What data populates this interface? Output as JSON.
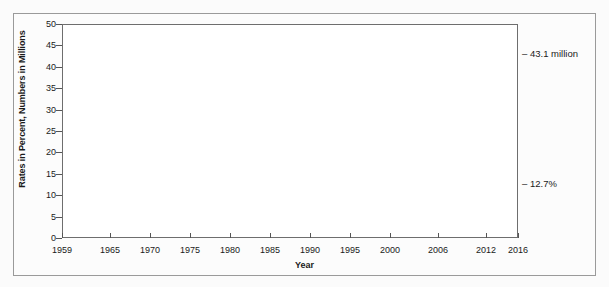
{
  "chart_data": {
    "type": "area",
    "title": "",
    "subtitle": "",
    "xlabel": "Year",
    "ylabel": "Rates in Percent, Numbers in Millions",
    "xlim": [
      1959,
      2016
    ],
    "ylim": [
      0,
      50
    ],
    "grid": false,
    "legend_position": "inside-plot-labels",
    "y_ticks": [
      50,
      45,
      40,
      35,
      30,
      25,
      20,
      15,
      10,
      5,
      0
    ],
    "x_ticks": [
      "1959",
      "1965",
      "1970",
      "1975",
      "1980",
      "1985",
      "1990",
      "1995",
      "2000",
      "2006",
      "2012",
      "2016"
    ],
    "x_tick_values": [
      1959,
      1965,
      1970,
      1975,
      1980,
      1985,
      1990,
      1995,
      2000,
      2006,
      2012,
      2016
    ],
    "series": [
      {
        "name": "Number in poverty",
        "unit": "millions",
        "color": "#3b3b3b",
        "label": "Number in poverty",
        "end_annotation": "43.1 million",
        "x": [
          1959,
          1960,
          1961,
          1962,
          1963,
          1964,
          1965,
          1966,
          1967,
          1968,
          1969,
          1970,
          1971,
          1972,
          1973,
          1974,
          1975,
          1976,
          1977,
          1978,
          1979,
          1980,
          1981,
          1982,
          1983,
          1984,
          1985,
          1986,
          1987,
          1988,
          1989,
          1990,
          1991,
          1992,
          1993,
          1994,
          1995,
          1996,
          1997,
          1998,
          1999,
          2000,
          2001,
          2002,
          2003,
          2004,
          2005,
          2006,
          2007,
          2008,
          2009,
          2010,
          2011,
          2012,
          2013,
          2014,
          2015,
          2016
        ],
        "values": [
          39.5,
          39.9,
          39.6,
          38.6,
          36.4,
          36.1,
          33.2,
          28.5,
          27.8,
          25.4,
          24.1,
          25.4,
          25.6,
          24.5,
          23.0,
          23.4,
          25.9,
          25.0,
          24.7,
          24.5,
          26.1,
          29.3,
          31.8,
          34.4,
          35.3,
          33.7,
          33.1,
          32.4,
          32.2,
          31.7,
          31.5,
          33.6,
          35.7,
          38.0,
          39.3,
          38.1,
          36.4,
          36.5,
          35.6,
          34.5,
          32.8,
          31.6,
          32.9,
          34.6,
          35.9,
          37.0,
          37.0,
          36.5,
          37.3,
          39.8,
          43.6,
          46.3,
          46.2,
          46.5,
          45.3,
          46.7,
          43.1,
          40.6
        ]
      },
      {
        "name": "Percent in poverty",
        "unit": "percent",
        "color": "#b5b5b5",
        "label": "Percent in poverty",
        "end_annotation": "12.7%",
        "x": [
          1959,
          1960,
          1961,
          1962,
          1963,
          1964,
          1965,
          1966,
          1967,
          1968,
          1969,
          1970,
          1971,
          1972,
          1973,
          1974,
          1975,
          1976,
          1977,
          1978,
          1979,
          1980,
          1981,
          1982,
          1983,
          1984,
          1985,
          1986,
          1987,
          1988,
          1989,
          1990,
          1991,
          1992,
          1993,
          1994,
          1995,
          1996,
          1997,
          1998,
          1999,
          2000,
          2001,
          2002,
          2003,
          2004,
          2005,
          2006,
          2007,
          2008,
          2009,
          2010,
          2011,
          2012,
          2013,
          2014,
          2015,
          2016
        ],
        "values": [
          22.4,
          22.2,
          21.9,
          21.0,
          19.5,
          19.0,
          17.3,
          14.7,
          14.2,
          12.8,
          12.1,
          12.6,
          12.5,
          11.9,
          11.1,
          11.2,
          12.3,
          11.8,
          11.6,
          11.4,
          11.7,
          13.0,
          14.0,
          15.0,
          15.2,
          14.4,
          14.0,
          13.6,
          13.4,
          13.0,
          12.8,
          13.5,
          14.2,
          14.8,
          15.1,
          14.5,
          13.8,
          13.7,
          13.3,
          12.7,
          11.9,
          11.3,
          11.7,
          12.1,
          12.5,
          12.7,
          12.6,
          12.3,
          12.5,
          13.2,
          14.3,
          15.1,
          15.0,
          15.0,
          14.5,
          14.8,
          13.5,
          12.7
        ]
      }
    ],
    "annotations": [
      {
        "text": "43.1 million",
        "at_year": 2016,
        "value": 43.1,
        "dash": "–"
      },
      {
        "text": "12.7%",
        "at_year": 2016,
        "value": 12.7,
        "dash": "–"
      }
    ],
    "inline_labels": [
      {
        "text": "Number in poverty",
        "area": "upper"
      },
      {
        "text": "Percent in poverty",
        "area": "lower"
      }
    ]
  },
  "colors": {
    "number_area": "#3b3b3b",
    "percent_area": "#b5b5b5",
    "plot_background": "#ffffff",
    "figure_background": "#fbfbfb",
    "frame_border": "#9a9a9a",
    "axis": "#6e6e6e",
    "text": "#1a1a1a",
    "inline_label_text": "#ffffff"
  }
}
